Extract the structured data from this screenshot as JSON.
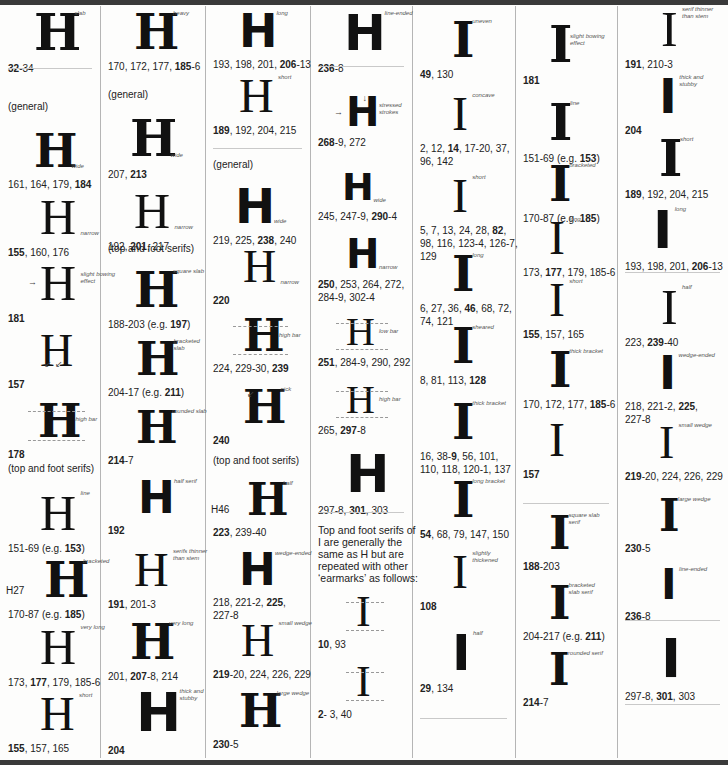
{
  "columns": [
    {
      "id": "col1",
      "entries": [
        {
          "note": "slab",
          "caption": [
            {
              "t": "32",
              "b": true
            },
            {
              "t": "-34"
            }
          ]
        },
        {
          "heading": "(general)"
        },
        {
          "note": "wide",
          "caption": [
            {
              "t": "161, 164, 179, "
            },
            {
              "t": "184",
              "b": true
            }
          ]
        },
        {
          "note": "narrow",
          "caption": [
            {
              "t": "155",
              "b": true
            },
            {
              "t": ", 160, 176"
            }
          ]
        },
        {
          "note": "slight bowing effect",
          "caption": [
            {
              "t": "181",
              "b": true
            }
          ]
        },
        {
          "note": "",
          "caption": [
            {
              "t": "157",
              "b": true
            }
          ]
        },
        {
          "note": "high bar",
          "caption": [
            {
              "t": "178",
              "b": true
            }
          ]
        },
        {
          "heading": "(top and foot serifs)"
        },
        {
          "note": "line",
          "caption": [
            {
              "t": "151-69 (e.g. "
            },
            {
              "t": "153",
              "b": true
            },
            {
              "t": ")"
            }
          ]
        },
        {
          "note": "bracketed",
          "prefix": "H27",
          "caption": [
            {
              "t": "170-87 (e.g. "
            },
            {
              "t": "185",
              "b": true
            },
            {
              "t": ")"
            }
          ]
        },
        {
          "note": "very long",
          "caption": [
            {
              "t": "173, "
            },
            {
              "t": "177",
              "b": true
            },
            {
              "t": ", 179, 185-6"
            }
          ]
        },
        {
          "note": "short",
          "caption": [
            {
              "t": "155",
              "b": true
            },
            {
              "t": ", 157, 165"
            }
          ]
        }
      ]
    },
    {
      "id": "col2",
      "entries": [
        {
          "note": "heavy",
          "caption": [
            {
              "t": "170, 172, 177, "
            },
            {
              "t": "185",
              "b": true
            },
            {
              "t": "-6"
            }
          ]
        },
        {
          "heading": "(general)"
        },
        {
          "note": "wide",
          "caption": [
            {
              "t": "207, "
            },
            {
              "t": "213",
              "b": true
            }
          ]
        },
        {
          "note": "narrow",
          "caption": [
            {
              "t": "192, "
            },
            {
              "t": "201",
              "b": true
            },
            {
              "t": ", 217"
            }
          ]
        },
        {
          "heading": "(top and foot serifs)"
        },
        {
          "note": "square slab",
          "caption": [
            {
              "t": "188-203 (e.g. "
            },
            {
              "t": "197",
              "b": true
            },
            {
              "t": ")"
            }
          ]
        },
        {
          "note": "bracketed slab",
          "caption": [
            {
              "t": "204-17 (e.g. "
            },
            {
              "t": "211",
              "b": true
            },
            {
              "t": ")"
            }
          ]
        },
        {
          "note": "rounded slab",
          "caption": [
            {
              "t": "214",
              "b": true
            },
            {
              "t": "-7"
            }
          ]
        },
        {
          "note": "half serif",
          "caption": [
            {
              "t": "192",
              "b": true
            }
          ]
        },
        {
          "note": "serifs thinner than stem",
          "caption": [
            {
              "t": "191",
              "b": true
            },
            {
              "t": ", 201-3"
            }
          ]
        },
        {
          "note": "very long",
          "caption": [
            {
              "t": "201, "
            },
            {
              "t": "207",
              "b": true
            },
            {
              "t": "-8, 214"
            }
          ]
        },
        {
          "note": "thick and stubby",
          "caption": [
            {
              "t": "204",
              "b": true
            }
          ]
        }
      ]
    },
    {
      "id": "col3",
      "entries": [
        {
          "note": "long",
          "caption": [
            {
              "t": "193, 198, 201, "
            },
            {
              "t": "206",
              "b": true
            },
            {
              "t": "-13"
            }
          ]
        },
        {
          "note": "short",
          "caption": [
            {
              "t": "189",
              "b": true
            },
            {
              "t": ", 192, 204, 215"
            }
          ]
        },
        {
          "heading": "(general)"
        },
        {
          "note": "wide",
          "caption": [
            {
              "t": "219, 225, "
            },
            {
              "t": "238",
              "b": true
            },
            {
              "t": ", 240"
            }
          ]
        },
        {
          "note": "narrow",
          "caption": [
            {
              "t": "220",
              "b": true
            }
          ]
        },
        {
          "note": "high bar",
          "caption": [
            {
              "t": "224, 229-30, "
            },
            {
              "t": "239",
              "b": true
            }
          ]
        },
        {
          "note": "nick",
          "caption": [
            {
              "t": "240",
              "b": true
            }
          ]
        },
        {
          "heading": "(top and foot serifs)"
        },
        {
          "note": "half",
          "prefix": "H46",
          "caption": [
            {
              "t": "223",
              "b": true
            },
            {
              "t": ", 239-40"
            }
          ]
        },
        {
          "note": "wedge-ended",
          "caption": [
            {
              "t": "218, 221-2, "
            },
            {
              "t": "225",
              "b": true
            },
            {
              "t": ","
            }
          ],
          "caption2": "227-8"
        },
        {
          "note": "small wedge",
          "caption": [
            {
              "t": "219",
              "b": true
            },
            {
              "t": "-20, 224, 226, 229"
            }
          ]
        },
        {
          "note": "large wedge",
          "caption": [
            {
              "t": "230",
              "b": true
            },
            {
              "t": "-5"
            }
          ]
        }
      ]
    },
    {
      "id": "col4",
      "entries": [
        {
          "note": "line-ended",
          "caption": [
            {
              "t": "236",
              "b": true
            },
            {
              "t": "-8"
            }
          ]
        },
        {
          "note": "stressed strokes",
          "caption": [
            {
              "t": "268",
              "b": true
            },
            {
              "t": "-9, 272"
            }
          ]
        },
        {
          "note": "wide",
          "caption": [
            {
              "t": "245, 247-9, "
            },
            {
              "t": "290",
              "b": true
            },
            {
              "t": "-4"
            }
          ]
        },
        {
          "note": "narrow",
          "caption": [
            {
              "t": "250",
              "b": true
            },
            {
              "t": ", 253, 264, 272,"
            }
          ],
          "caption2": "284-9, 302-4"
        },
        {
          "note": "low bar",
          "caption": [
            {
              "t": "251",
              "b": true
            },
            {
              "t": ", 284-9, 290, 292"
            }
          ]
        },
        {
          "note": "high bar",
          "caption": [
            {
              "t": "265, "
            },
            {
              "t": "297",
              "b": true
            },
            {
              "t": "-8"
            }
          ]
        },
        {
          "note": "",
          "caption": [
            {
              "t": "297-8, "
            },
            {
              "t": "301",
              "b": true
            },
            {
              "t": ", 303"
            }
          ]
        },
        {
          "paragraph": "Top and foot serifs of I are generally the same as H but are repeated with other ‘earmarks’ as follows:"
        },
        {
          "note": "",
          "caption": [
            {
              "t": "10",
              "b": true
            },
            {
              "t": ", 93"
            }
          ]
        },
        {
          "note": "",
          "caption": [
            {
              "t": "2",
              "b": true
            },
            {
              "t": "- 3, 40"
            }
          ]
        }
      ]
    },
    {
      "id": "col5",
      "entries": [
        {
          "note": "uneven",
          "caption": [
            {
              "t": "49",
              "b": true
            },
            {
              "t": ", 130"
            }
          ]
        },
        {
          "note": "concave",
          "caption": [
            {
              "t": "2, 12, "
            },
            {
              "t": "14",
              "b": true
            },
            {
              "t": ", 17-20, 37,"
            }
          ],
          "caption2": "96, 142"
        },
        {
          "note": "short",
          "caption": [
            {
              "t": "5, 7, 13, 24, 28, "
            },
            {
              "t": "82",
              "b": true
            },
            {
              "t": ","
            }
          ],
          "caption2": "98, 116, 123-4, 126-7,",
          "caption3": "129"
        },
        {
          "note": "long",
          "caption": [
            {
              "t": "6, 27, 36, "
            },
            {
              "t": "46",
              "b": true
            },
            {
              "t": ", 68, 72,"
            }
          ],
          "caption2": "74, 121"
        },
        {
          "note": "sheared",
          "caption": [
            {
              "t": "8, 81, 113, "
            },
            {
              "t": "128",
              "b": true
            }
          ]
        },
        {
          "note": "thick bracket",
          "caption": [
            {
              "t": "16, 38-"
            },
            {
              "t": "9",
              "b": true
            },
            {
              "t": ", 56, 101,"
            }
          ],
          "caption2": "110, 118, 120-1, 137"
        },
        {
          "note": "long bracket",
          "caption": [
            {
              "t": "54",
              "b": true
            },
            {
              "t": ", 68, 79, 147, 150"
            }
          ]
        },
        {
          "note": "slightly thickened",
          "caption": [
            {
              "t": "108",
              "b": true
            }
          ]
        },
        {
          "note": "half",
          "caption": [
            {
              "t": "29",
              "b": true
            },
            {
              "t": ", 134"
            }
          ]
        }
      ]
    },
    {
      "id": "col6",
      "entries": [
        {
          "note": "slight bowing effect",
          "caption": [
            {
              "t": "181",
              "b": true
            }
          ]
        },
        {
          "note": "line",
          "caption": [
            {
              "t": "151-69 (e.g. "
            },
            {
              "t": "153",
              "b": true
            },
            {
              "t": ")"
            }
          ]
        },
        {
          "note": "bracketed",
          "caption": [
            {
              "t": "170-87 (e.g. "
            },
            {
              "t": "185",
              "b": true
            },
            {
              "t": ")"
            }
          ]
        },
        {
          "note": "long",
          "caption": [
            {
              "t": "173, "
            },
            {
              "t": "177",
              "b": true
            },
            {
              "t": ", 179, 185-6"
            }
          ]
        },
        {
          "note": "short",
          "caption": [
            {
              "t": "155",
              "b": true
            },
            {
              "t": ", 157, 165"
            }
          ]
        },
        {
          "note": "thick bracket",
          "caption": [
            {
              "t": "170, 172, 177, "
            },
            {
              "t": "185",
              "b": true
            },
            {
              "t": "-6"
            }
          ]
        },
        {
          "note": "",
          "caption": [
            {
              "t": "157",
              "b": true
            }
          ]
        },
        {
          "note": "square slab serif",
          "caption": [
            {
              "t": "188",
              "b": true
            },
            {
              "t": "-203"
            }
          ]
        },
        {
          "note": "bracketed slab serif",
          "caption": [
            {
              "t": "204-217 (e.g. "
            },
            {
              "t": "211",
              "b": true
            },
            {
              "t": ")"
            }
          ]
        },
        {
          "note": "rounded serif",
          "caption": [
            {
              "t": "214",
              "b": true
            },
            {
              "t": "-7"
            }
          ]
        }
      ]
    },
    {
      "id": "col7",
      "entries": [
        {
          "note": "serif thinner than stem",
          "caption": [
            {
              "t": "191",
              "b": true
            },
            {
              "t": ", 210-3"
            }
          ]
        },
        {
          "note": "thick and stubby",
          "caption": [
            {
              "t": "204",
              "b": true
            }
          ]
        },
        {
          "note": "short",
          "caption": [
            {
              "t": "189",
              "b": true
            },
            {
              "t": ", 192, 204, 215"
            }
          ]
        },
        {
          "note": "long",
          "caption": [
            {
              "t": "193, 198, 201, "
            },
            {
              "t": "206",
              "b": true
            },
            {
              "t": "-13"
            }
          ]
        },
        {
          "note": "half",
          "caption": [
            {
              "t": "223, "
            },
            {
              "t": "239",
              "b": true
            },
            {
              "t": "-40"
            }
          ]
        },
        {
          "note": "wedge-ended",
          "caption": [
            {
              "t": "218, 221-2, "
            },
            {
              "t": "225",
              "b": true
            },
            {
              "t": ","
            }
          ],
          "caption2": "227-8"
        },
        {
          "note": "small wedge",
          "caption": [
            {
              "t": "219",
              "b": true
            },
            {
              "t": "-20, 224, 226, 229"
            }
          ]
        },
        {
          "note": "large wedge",
          "caption": [
            {
              "t": "230",
              "b": true
            },
            {
              "t": "-5"
            }
          ]
        },
        {
          "note": "line-ended",
          "caption": [
            {
              "t": "236",
              "b": true
            },
            {
              "t": "-8"
            }
          ]
        },
        {
          "note": "",
          "caption": [
            {
              "t": "297-8, "
            },
            {
              "t": "301",
              "b": true
            },
            {
              "t": ", 303"
            }
          ]
        }
      ]
    }
  ],
  "glyphs": {
    "h": "H",
    "i": "I"
  }
}
